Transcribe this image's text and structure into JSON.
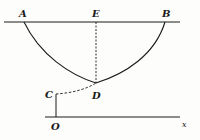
{
  "figure": {
    "colors": {
      "ink": "#1a1a1a",
      "paper": "#fdfdfb"
    },
    "labels": {
      "A": "A",
      "E": "E",
      "B": "B",
      "C": "C",
      "D": "D",
      "O": "O",
      "x": "x"
    },
    "elements": {
      "top_line": "horizontal line through A, E, B",
      "curve": "curve from A through D to B",
      "ED": "dashed vertical segment from E to D",
      "CD": "dashed curve from C to D",
      "OC": "solid vertical segment from O to C",
      "axis": "horizontal axis through O toward x"
    }
  }
}
